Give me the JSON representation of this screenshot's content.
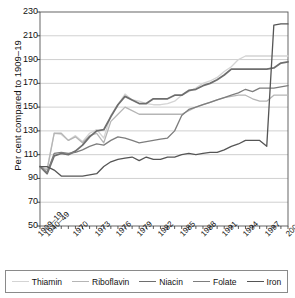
{
  "chart_data": {
    "type": "line",
    "title": "",
    "xlabel": "",
    "ylabel": "Per cent compared to 1909–19",
    "ylim": [
      50,
      230
    ],
    "yticks": [
      230,
      210,
      190,
      170,
      150,
      130,
      110,
      90,
      70,
      50
    ],
    "grid": true,
    "legend_position": "bottom",
    "x_tick_labels": [
      "1909–19",
      "1940–49",
      "1970",
      "1973",
      "1976",
      "1979",
      "1982",
      "1985",
      "1988",
      "1991",
      "1994",
      "1997",
      "2000"
    ],
    "x": [
      "1909-19",
      "1940-49",
      "1967",
      "1968",
      "1969",
      "1970",
      "1971",
      "1972",
      "1973",
      "1974",
      "1975",
      "1976",
      "1977",
      "1978",
      "1979",
      "1980",
      "1981",
      "1982",
      "1983",
      "1984",
      "1985",
      "1986",
      "1987",
      "1988",
      "1989",
      "1990",
      "1991",
      "1992",
      "1993",
      "1994",
      "1995",
      "1996",
      "1997",
      "1998",
      "1999",
      "2000"
    ],
    "series": [
      {
        "name": "Thiamin",
        "color": "#d4d4d4",
        "width": 1.3,
        "values": [
          100,
          98,
          128,
          127,
          122,
          126,
          121,
          128,
          131,
          124,
          143,
          152,
          161,
          156,
          155,
          153,
          152,
          152,
          153,
          155,
          160,
          163,
          166,
          170,
          172,
          175,
          180,
          184,
          190,
          193,
          193,
          193,
          193,
          193,
          193,
          193
        ]
      },
      {
        "name": "Riboflavin",
        "color": "#b5b5b5",
        "width": 1.3,
        "values": [
          100,
          97,
          128,
          128,
          122,
          125,
          120,
          126,
          128,
          120,
          138,
          144,
          150,
          147,
          144,
          144,
          144,
          144,
          144,
          144,
          144,
          147,
          150,
          152,
          154,
          156,
          158,
          159,
          160,
          160,
          157,
          155,
          155,
          160,
          160,
          160
        ]
      },
      {
        "name": "Niacin",
        "color": "#6e6e6e",
        "width": 1.8,
        "values": [
          100,
          94,
          109,
          111,
          110,
          113,
          118,
          125,
          130,
          131,
          142,
          152,
          159,
          156,
          153,
          153,
          157,
          157,
          157,
          160,
          160,
          164,
          165,
          168,
          170,
          173,
          177,
          182,
          182,
          182,
          182,
          182,
          182,
          183,
          187,
          188
        ]
      },
      {
        "name": "Folate",
        "color": "#7d7d7d",
        "width": 1.3,
        "values": [
          100,
          95,
          111,
          112,
          111,
          112,
          114,
          117,
          119,
          118,
          122,
          125,
          124,
          122,
          120,
          121,
          122,
          123,
          124,
          130,
          143,
          148,
          150,
          152,
          154,
          156,
          158,
          160,
          162,
          165,
          163,
          166,
          166,
          166,
          167,
          168
        ]
      },
      {
        "name": "Iron",
        "color": "#555555",
        "width": 1.3,
        "values": [
          100,
          100,
          97,
          92,
          92,
          92,
          92,
          93,
          94,
          100,
          104,
          106,
          107,
          108,
          105,
          108,
          106,
          106,
          108,
          108,
          110,
          111,
          110,
          111,
          112,
          112,
          114,
          117,
          119,
          122,
          122,
          122,
          117,
          219,
          220,
          220
        ]
      }
    ]
  },
  "legend": {
    "items": [
      {
        "label": "Thiamin"
      },
      {
        "label": "Riboflavin"
      },
      {
        "label": "Niacin"
      },
      {
        "label": "Folate"
      },
      {
        "label": "Iron"
      }
    ]
  }
}
